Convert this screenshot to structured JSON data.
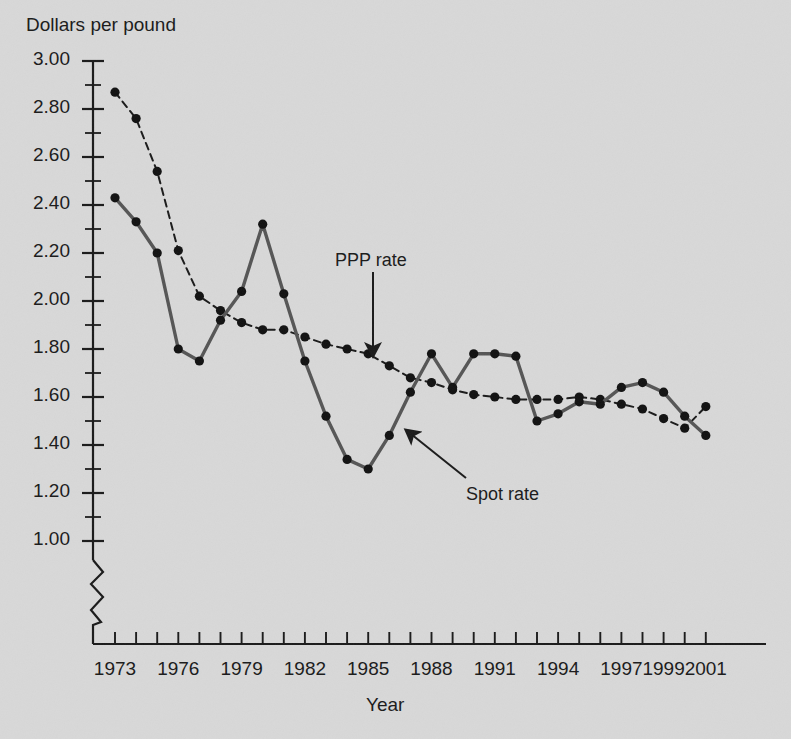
{
  "chart_data": {
    "type": "line",
    "title": "",
    "ylabel": "Dollars per pound",
    "xlabel": "Year",
    "ylim": [
      1.0,
      3.0
    ],
    "ytick_step": 0.2,
    "yminor_step": 0.1,
    "grid": false,
    "axis_break_below": 1.0,
    "xlim": [
      1973,
      2001
    ],
    "ytick_labels": [
      "3.00",
      "2.80",
      "2.60",
      "2.40",
      "2.20",
      "2.00",
      "1.80",
      "1.60",
      "1.40",
      "1.20",
      "1.00"
    ],
    "ytick_values": [
      3.0,
      2.8,
      2.6,
      2.4,
      2.2,
      2.0,
      1.8,
      1.6,
      1.4,
      1.2,
      1.0
    ],
    "xtick_labels": [
      "1973",
      "1976",
      "1979",
      "1982",
      "1985",
      "1988",
      "1991",
      "1994",
      "1997",
      "1999",
      "2001"
    ],
    "xtick_values": [
      1973,
      1976,
      1979,
      1982,
      1985,
      1988,
      1991,
      1994,
      1997,
      1999,
      2001
    ],
    "x": [
      1973,
      1974,
      1975,
      1976,
      1977,
      1978,
      1979,
      1980,
      1981,
      1982,
      1983,
      1984,
      1985,
      1986,
      1987,
      1988,
      1989,
      1990,
      1991,
      1992,
      1993,
      1994,
      1995,
      1996,
      1997,
      1998,
      1999,
      2000,
      2001
    ],
    "series": [
      {
        "name": "PPP rate",
        "style": "dashed",
        "color": "#1a1a1a",
        "values": [
          2.87,
          2.76,
          2.54,
          2.21,
          2.02,
          1.96,
          1.91,
          1.88,
          1.88,
          1.85,
          1.82,
          1.8,
          1.78,
          1.73,
          1.68,
          1.66,
          1.63,
          1.61,
          1.6,
          1.59,
          1.59,
          1.59,
          1.6,
          1.59,
          1.57,
          1.55,
          1.51,
          1.47,
          1.56
        ]
      },
      {
        "name": "Spot rate",
        "style": "solid",
        "color": "#555555",
        "values": [
          2.43,
          2.33,
          2.2,
          1.8,
          1.75,
          1.92,
          2.04,
          2.32,
          2.03,
          1.75,
          1.52,
          1.34,
          1.3,
          1.44,
          1.62,
          1.78,
          1.64,
          1.78,
          1.78,
          1.77,
          1.5,
          1.53,
          1.58,
          1.57,
          1.64,
          1.66,
          1.62,
          1.52,
          1.44
        ]
      }
    ],
    "annotations": [
      {
        "name": "ppp-rate-annotation",
        "text": "PPP rate",
        "label_x": 335,
        "label_y": 250,
        "arrow_from_x": 373,
        "arrow_from_y": 272,
        "arrow_to_x": 373,
        "arrow_to_y": 356
      },
      {
        "name": "spot-rate-annotation",
        "text": "Spot rate",
        "label_x": 466,
        "label_y": 484,
        "arrow_from_x": 466,
        "arrow_from_y": 478,
        "arrow_to_x": 406,
        "arrow_to_y": 430
      }
    ]
  },
  "colors": {
    "background": "#d8d8d8",
    "axis": "#1a1a1a",
    "spot": "#555555",
    "ppp": "#1a1a1a",
    "text": "#1a1a1a"
  }
}
